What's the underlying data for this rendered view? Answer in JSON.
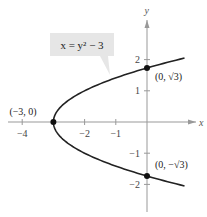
{
  "chart_data": {
    "type": "line",
    "title": "",
    "equation_label": "x = y² − 3",
    "xlabel": "x",
    "ylabel": "y",
    "xlim": [
      -4.5,
      1.5
    ],
    "ylim": [
      -2.7,
      2.9
    ],
    "x_ticks": [
      {
        "value": -4,
        "label": "−4"
      },
      {
        "value": -2,
        "label": "−2"
      },
      {
        "value": -1,
        "label": "−1"
      }
    ],
    "y_ticks": [
      {
        "value": 2,
        "label": "2"
      },
      {
        "value": 1,
        "label": "1"
      },
      {
        "value": -1,
        "label": "−1"
      },
      {
        "value": -2,
        "label": "−2"
      }
    ],
    "series": [
      {
        "name": "x = y^2 - 3",
        "function": "x = y^2 - 3",
        "y_range": [
          -2.05,
          2.05
        ],
        "color": "#222222"
      }
    ],
    "points": [
      {
        "x": -3,
        "y": 0,
        "label": "(−3, 0)"
      },
      {
        "x": 0,
        "y": 1.732,
        "label": "(0, √3)"
      },
      {
        "x": 0,
        "y": -1.732,
        "label": "(0, −√3)"
      }
    ],
    "grid": false,
    "colors": {
      "axis": "#999999",
      "curve": "#222222",
      "label_box": "#e6e6e6"
    }
  }
}
